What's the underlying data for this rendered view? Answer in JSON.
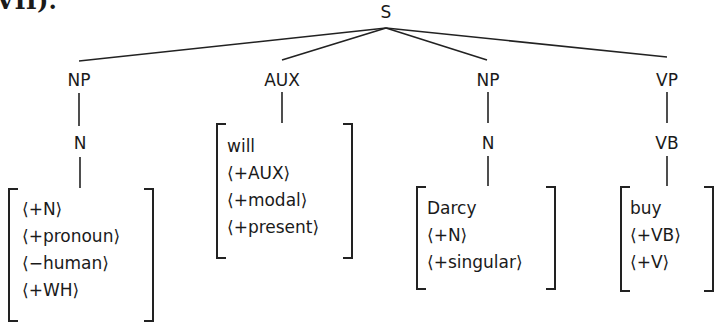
{
  "header_fragment": "VII).",
  "tree": {
    "root": "S",
    "children": [
      {
        "label": "NP",
        "child": "N",
        "features": [
          "⟨+N⟩",
          "⟨+pronoun⟩",
          "⟨−human⟩",
          "⟨+WH⟩"
        ]
      },
      {
        "label": "AUX",
        "features": [
          "will",
          "⟨+AUX⟩",
          "⟨+modal⟩",
          "⟨+present⟩"
        ]
      },
      {
        "label": "NP",
        "child": "N",
        "features": [
          "Darcy",
          "⟨+N⟩",
          "⟨+singular⟩"
        ]
      },
      {
        "label": "VP",
        "child": "VB",
        "features": [
          "buy",
          "⟨+VB⟩",
          "⟨+V⟩"
        ]
      }
    ]
  }
}
